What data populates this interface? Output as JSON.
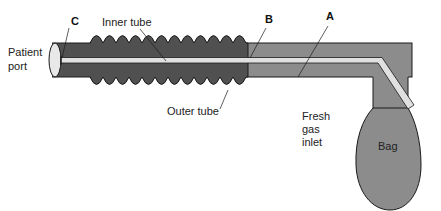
{
  "diagram": {
    "labels": {
      "patient_port_line1": "Patient",
      "patient_port_line2": "port",
      "point_c": "C",
      "inner_tube": "Inner tube",
      "point_b": "B",
      "point_a": "A",
      "outer_tube": "Outer tube",
      "fresh_gas_line1": "Fresh",
      "fresh_gas_line2": "gas",
      "fresh_gas_line3": "inlet",
      "bag": "Bag"
    },
    "colors": {
      "corrugated_tube": "#505050",
      "smooth_tube": "#8c8c8c",
      "inner_tube": "#e0e0e0",
      "outline": "#1a1a1a",
      "port_end": "#e8e8e8"
    }
  }
}
